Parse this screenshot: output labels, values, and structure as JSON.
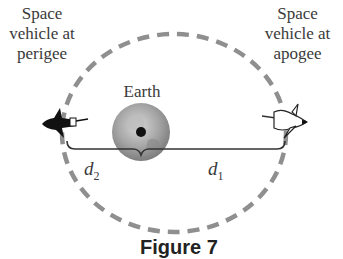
{
  "labels": {
    "perigee_line1": "Space",
    "perigee_line2": "vehicle at",
    "perigee_line3": "perigee",
    "apogee_line1": "Space",
    "apogee_line2": "vehicle at",
    "apogee_line3": "apogee",
    "earth": "Earth",
    "d2_var": "d",
    "d2_sub": "2",
    "d1_var": "d",
    "d1_sub": "1",
    "figure_caption": "Figure 7"
  },
  "colors": {
    "orbit": "#8f8f8f",
    "earth": "#9a9a9a",
    "text": "#3a3a3a"
  }
}
